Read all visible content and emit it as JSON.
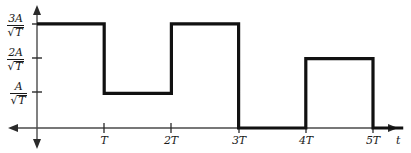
{
  "figure": {
    "background": "#ffffff",
    "ink_color": "#1a1a1a",
    "axis_color": "#3a3a3a"
  },
  "axes": {
    "x_axis_name": "t",
    "y_ticks": [
      {
        "id": "y3",
        "numerator": "3A",
        "sqrt_radicand": "T",
        "value": 3
      },
      {
        "id": "y2",
        "numerator": "2A",
        "sqrt_radicand": "T",
        "value": 2
      },
      {
        "id": "y1",
        "numerator": "A",
        "sqrt_radicand": "T",
        "value": 1
      }
    ],
    "x_ticks": [
      {
        "label": "T",
        "value": 1
      },
      {
        "label": "2T",
        "value": 2
      },
      {
        "label": "3T",
        "value": 3
      },
      {
        "label": "4T",
        "value": 4
      },
      {
        "label": "5T",
        "value": 5
      }
    ],
    "sqrt_glyph": "√"
  },
  "chart_data": {
    "type": "line",
    "title": "",
    "xlabel": "t",
    "ylabel": "",
    "grid": false,
    "legend": false,
    "step_style": "post",
    "xlim": [
      -0.5,
      5.6
    ],
    "ylim": [
      0,
      3.3
    ],
    "x_tick_values": [
      1,
      2,
      3,
      4,
      5
    ],
    "x_tick_labels": [
      "T",
      "2T",
      "3T",
      "4T",
      "5T"
    ],
    "y_tick_values": [
      1,
      2,
      3
    ],
    "y_tick_labels": [
      "A/√T",
      "2A/√T",
      "3A/√T"
    ],
    "series": [
      {
        "name": "signal",
        "segments": [
          {
            "x_start": 0,
            "x_end": 1,
            "y": 3
          },
          {
            "x_start": 1,
            "x_end": 2,
            "y": 1
          },
          {
            "x_start": 2,
            "x_end": 3,
            "y": 3
          },
          {
            "x_start": 3,
            "x_end": 4,
            "y": 0
          },
          {
            "x_start": 4,
            "x_end": 5,
            "y": 2
          },
          {
            "x_start": 5,
            "x_end": 5.45,
            "y": 0
          }
        ],
        "x": [
          0,
          1,
          1,
          2,
          2,
          3,
          3,
          4,
          4,
          5,
          5,
          5.45
        ],
        "y": [
          3,
          3,
          1,
          1,
          3,
          3,
          0,
          0,
          2,
          2,
          0,
          0
        ]
      }
    ]
  }
}
